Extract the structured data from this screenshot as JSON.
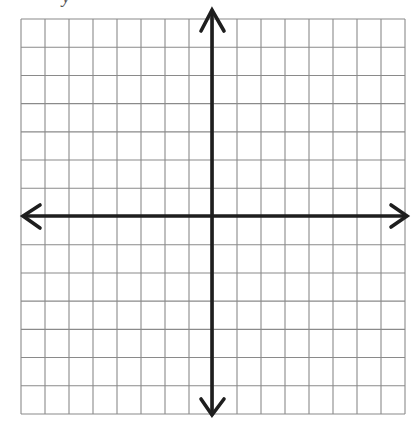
{
  "figure": {
    "type": "coordinate-plane",
    "caption_fragment": "y",
    "grid": {
      "columns": 16,
      "rows": 14,
      "left": 21,
      "top": 19,
      "right": 405,
      "bottom": 414,
      "line_color": "#8a8a8a",
      "line_width": 1.1
    },
    "axes": {
      "color": "#1e1e1e",
      "width": 3.6,
      "origin_col": 8,
      "origin_row": 7,
      "x_axis": {
        "from": 24,
        "to": 406,
        "y": 216
      },
      "y_axis": {
        "from": 11,
        "to": 414,
        "x": 212
      },
      "arrows": {
        "up": {
          "tip": [
            212,
            10
          ],
          "wing1": [
            201,
            31
          ],
          "wing2": [
            224,
            31
          ]
        },
        "down": {
          "tip": [
            212,
            415
          ],
          "wing1": [
            201,
            399
          ],
          "wing2": [
            224,
            399
          ]
        },
        "left": {
          "tip": [
            23,
            216
          ],
          "wing1": [
            40,
            205
          ],
          "wing2": [
            40,
            228
          ]
        },
        "right": {
          "tip": [
            407,
            216
          ],
          "wing1": [
            391,
            205
          ],
          "wing2": [
            391,
            227
          ]
        }
      }
    },
    "background": "#ffffff"
  }
}
